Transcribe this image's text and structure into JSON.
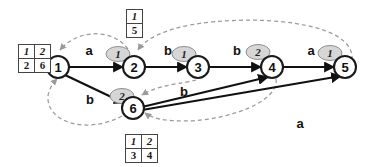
{
  "diagram": {
    "colors": {
      "node_stroke": "#1a1a1a",
      "solid_edge": "#111111",
      "dashed_edge": "#9a9a9a",
      "badge_fill": "#d6d6d6",
      "table_border": "#444444",
      "background": "#ffffff"
    },
    "nodes": [
      {
        "id": "node-1",
        "label": "1",
        "x": 58,
        "y": 67
      },
      {
        "id": "node-2",
        "label": "2",
        "x": 134,
        "y": 67
      },
      {
        "id": "node-3",
        "label": "3",
        "x": 198,
        "y": 67
      },
      {
        "id": "node-4",
        "label": "4",
        "x": 272,
        "y": 67
      },
      {
        "id": "node-5",
        "label": "5",
        "x": 345,
        "y": 67
      },
      {
        "id": "node-6",
        "label": "6",
        "x": 133,
        "y": 108
      }
    ],
    "solid_edges": [
      {
        "id": "edge-1-2",
        "from": "1",
        "to": "2",
        "label": "a",
        "label_x": 89,
        "label_y": 50
      },
      {
        "id": "edge-2-3",
        "from": "2",
        "to": "3",
        "label": "b",
        "label_x": 168,
        "label_y": 50
      },
      {
        "id": "edge-3-4",
        "from": "3",
        "to": "4",
        "label": "b",
        "label_x": 237,
        "label_y": 50
      },
      {
        "id": "edge-4-5",
        "from": "4",
        "to": "5",
        "label": "a",
        "label_x": 311,
        "label_y": 50
      },
      {
        "id": "edge-1-6",
        "from": "1",
        "to": "6",
        "label": "b",
        "label_x": 90,
        "label_y": 99
      },
      {
        "id": "edge-6-4",
        "from": "6",
        "to": "4",
        "label": "b",
        "label_x": 184,
        "label_y": 91
      },
      {
        "id": "edge-6-5",
        "from": "6",
        "to": "5",
        "label": "a",
        "label_x": 300,
        "label_y": 123
      }
    ],
    "badges": [
      {
        "id": "badge-node-2",
        "value": "1",
        "x": 118,
        "y": 54,
        "italic": true
      },
      {
        "id": "badge-node-3",
        "value": "1",
        "x": 184,
        "y": 54,
        "italic": true
      },
      {
        "id": "badge-node-4",
        "value": "2",
        "x": 258,
        "y": 52,
        "italic": false
      },
      {
        "id": "badge-node-5",
        "value": "1",
        "x": 330,
        "y": 53,
        "italic": true
      },
      {
        "id": "badge-node-6",
        "value": "2",
        "x": 122,
        "y": 96,
        "italic": false
      }
    ],
    "tables": [
      {
        "id": "table-node-1",
        "position": "left-of-node-1",
        "left": 18,
        "top": 44,
        "header": [
          "1",
          "2"
        ],
        "values": [
          "2",
          "6"
        ]
      },
      {
        "id": "table-node-2",
        "position": "above-node-2",
        "left": 126,
        "top": 9,
        "header": [
          "1"
        ],
        "values": [
          "5"
        ]
      },
      {
        "id": "table-node-6",
        "position": "below-node-6",
        "left": 125,
        "top": 134,
        "header": [
          "1",
          "2"
        ],
        "values": [
          "3",
          "4"
        ]
      }
    ],
    "dashed_arcs": [
      {
        "id": "dashed-2-to-1",
        "desc": "from node 2 area arcing left, arrow into top of node 1"
      },
      {
        "id": "dashed-5-to-2",
        "desc": "long arc from node 5 region to top of node 2"
      },
      {
        "id": "dashed-3-to-6",
        "desc": "arc from node 3 area down-left, arrow into node 6"
      },
      {
        "id": "dashed-6-to-1",
        "desc": "arc looping below, arrow up into bottom of node 1"
      },
      {
        "id": "dashed-4-to-6",
        "desc": "arc from node 4 curving down-left, arrow into node 6 right side"
      }
    ]
  }
}
